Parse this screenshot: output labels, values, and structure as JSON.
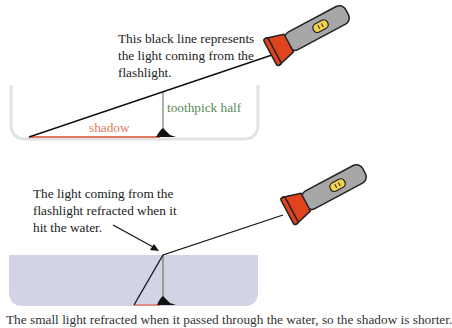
{
  "diagram": {
    "top_panel": {
      "caption_lines": [
        "This black line represents",
        "the light coming from the",
        "flashlight."
      ],
      "toothpick_label": "toothpick half",
      "shadow_label": "shadow"
    },
    "bottom_panel": {
      "caption_lines": [
        "The light coming from the",
        "flashlight refracted when it",
        "hit the water."
      ]
    },
    "cutoff_caption": "The small light refracted when it passed through the water, so the shadow is shorter.",
    "colors": {
      "light_ray": "#111111",
      "toothpick": "#5a8a55",
      "shadow": "#e07a5f",
      "water": "#d3d3e6",
      "bowl_outline": "#dcdcdc",
      "flashlight_body": "#a7a7a7",
      "flashlight_head": "#e0441e",
      "flashlight_switch": "#f0d34a"
    }
  }
}
